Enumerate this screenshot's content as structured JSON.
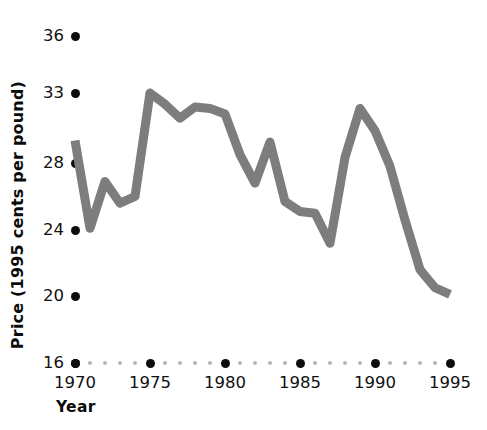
{
  "chart_data": {
    "type": "line",
    "title": "",
    "xlabel": "Year",
    "ylabel": "Price (1995 cents per pound)",
    "grid": false,
    "legend": false,
    "line_color": "#7d7d7d",
    "axis_color": "#0d0d0d",
    "minor_tick_color": "#b6b6b6",
    "xlim": [
      1970,
      1995
    ],
    "ylim": [
      16,
      36
    ],
    "xticks": [
      1970,
      1975,
      1980,
      1985,
      1990,
      1995
    ],
    "xtick_labels": [
      "1970",
      "1975",
      "1980",
      "1985",
      "1990",
      "1995"
    ],
    "yticks": [
      16,
      20,
      24,
      28,
      33,
      36
    ],
    "ytick_labels": [
      "16",
      "20",
      "24",
      "28",
      "33",
      "36"
    ],
    "x": [
      1970,
      1971,
      1972,
      1973,
      1974,
      1975,
      1976,
      1977,
      1978,
      1979,
      1980,
      1981,
      1982,
      1983,
      1984,
      1985,
      1986,
      1987,
      1988,
      1989,
      1990,
      1991,
      1992,
      1993,
      1994,
      1995
    ],
    "values": [
      29.6,
      24.1,
      26.9,
      25.6,
      26.0,
      33.0,
      32.2,
      31.2,
      32.0,
      31.9,
      31.5,
      28.6,
      26.8,
      29.5,
      25.7,
      25.1,
      25.0,
      23.2,
      28.4,
      31.9,
      30.3,
      27.8,
      24.6,
      21.6,
      20.5,
      20.1
    ],
    "series_name": "Price"
  }
}
